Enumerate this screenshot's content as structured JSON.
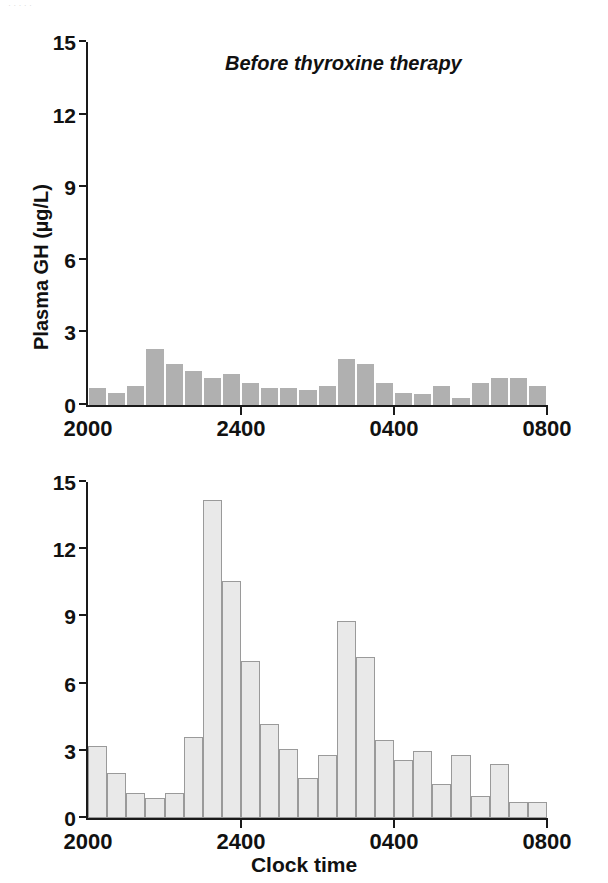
{
  "scan_sliver_text": "· · · · ·",
  "axis": {
    "y_ticks": [
      0,
      3,
      6,
      9,
      12,
      15
    ],
    "y_tick_labels": [
      "0",
      "3",
      "6",
      "9",
      "12",
      "15"
    ],
    "x_ticks": [
      0,
      8,
      16,
      24
    ],
    "x_tick_labels": [
      "2000",
      "2400",
      "0400",
      "0800"
    ],
    "xlabel": "Clock time",
    "ylabel": "Plasma GH (µg/L)"
  },
  "panels": {
    "before": {
      "title": "Before thyroxine therapy"
    },
    "after": {
      "title": "After thyroxine therapy"
    }
  },
  "colors": {
    "bar_before": "#b0b0b0",
    "bar_after_fill": "#e9e9e9",
    "bar_after_stroke": "#9a9a9a",
    "axis": "#1a1a1a",
    "text": "#111111",
    "background": "#ffffff"
  },
  "chart_data": [
    {
      "type": "bar",
      "id": "before-thyroxine-therapy",
      "title": "Before thyroxine therapy",
      "xlabel": "",
      "ylabel": "Plasma GH (µg/L)",
      "ylim": [
        0,
        15
      ],
      "yticks": [
        0,
        3,
        6,
        9,
        12,
        15
      ],
      "xlim": [
        0,
        24
      ],
      "xticks": [
        0,
        8,
        16,
        24
      ],
      "xticklabels": [
        "2000",
        "2400",
        "0400",
        "0800"
      ],
      "grid": false,
      "legend": "none",
      "bin_count": 24,
      "bin_width_hours": 0.5,
      "categories": [
        "2000",
        "2030",
        "2100",
        "2130",
        "2200",
        "2230",
        "2300",
        "2330",
        "2400",
        "0030",
        "0100",
        "0130",
        "0200",
        "0230",
        "0300",
        "0330",
        "0400",
        "0430",
        "0500",
        "0530",
        "0600",
        "0630",
        "0700",
        "0730"
      ],
      "values": [
        0.7,
        0.5,
        0.8,
        2.3,
        1.7,
        1.4,
        1.1,
        1.3,
        0.9,
        0.7,
        0.7,
        0.6,
        0.8,
        1.9,
        1.7,
        0.9,
        0.5,
        0.45,
        0.8,
        0.3,
        0.9,
        1.1,
        1.1,
        0.8
      ],
      "units": "µg/L"
    },
    {
      "type": "bar",
      "id": "after-thyroxine-therapy",
      "title": "After thyroxine therapy",
      "xlabel": "Clock time",
      "ylabel": "Plasma GH (µg/L)",
      "ylim": [
        0,
        15
      ],
      "yticks": [
        0,
        3,
        6,
        9,
        12,
        15
      ],
      "xlim": [
        0,
        24
      ],
      "xticks": [
        0,
        8,
        16,
        24
      ],
      "xticklabels": [
        "2000",
        "2400",
        "0400",
        "0800"
      ],
      "grid": false,
      "legend": "none",
      "bin_count": 24,
      "bin_width_hours": 0.5,
      "categories": [
        "2000",
        "2030",
        "2100",
        "2130",
        "2200",
        "2230",
        "2300",
        "2330",
        "2400",
        "0030",
        "0100",
        "0130",
        "0200",
        "0230",
        "0300",
        "0330",
        "0400",
        "0430",
        "0500",
        "0530",
        "0600",
        "0630",
        "0700",
        "0730"
      ],
      "values": [
        3.2,
        2.0,
        1.1,
        0.9,
        1.1,
        3.6,
        14.2,
        10.6,
        7.0,
        4.2,
        3.1,
        1.8,
        2.8,
        8.8,
        7.2,
        3.5,
        2.6,
        3.0,
        1.5,
        2.8,
        1.0,
        2.4,
        0.7,
        0.7
      ],
      "units": "µg/L"
    }
  ]
}
